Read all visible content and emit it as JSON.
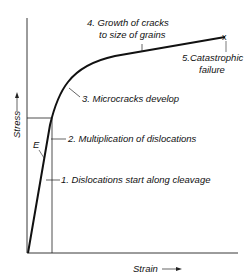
{
  "diagram": {
    "type": "stress-strain curve",
    "axes": {
      "x_label": "Strain",
      "y_label": "Stress"
    },
    "modulus_label": "E",
    "stages": [
      {
        "number": 1,
        "label": "1. Dislocations start along cleavage"
      },
      {
        "number": 2,
        "label": "2. Multiplication of dislocations"
      },
      {
        "number": 3,
        "label": "3. Microcracks develop"
      },
      {
        "number": 4,
        "label_line1": "4. Growth of cracks",
        "label_line2": "to size of grains"
      },
      {
        "number": 5,
        "label_line1": "5.Catastrophic",
        "label_line2": "failure"
      }
    ],
    "failure_marker": "x",
    "colors": {
      "line": "#111111",
      "background": "#ffffff"
    }
  }
}
